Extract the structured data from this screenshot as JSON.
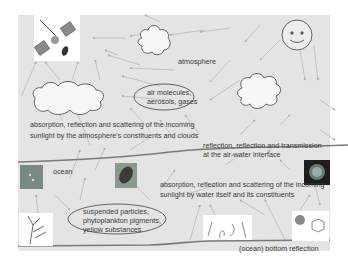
{
  "diagram": {
    "labels": {
      "atmosphere": "atmosphere",
      "ocean": "ocean",
      "air_constituents_line1": "air molecules,",
      "air_constituents_line2": "aerosols, gases",
      "atmo_process_line1": "absorption, reflection and scattering of the incoming",
      "atmo_process_line2": "sunlight by the atmosphere's constituents and clouds",
      "interface_line1": "reflection, reflection and transmission",
      "interface_line2": "at the air-water interface",
      "water_process_line1": "absorption, reflection and scattering of the incoming",
      "water_process_line2": "sunlight by water itself and its constituents",
      "water_constituents_line1": "suspended particles,",
      "water_constituents_line2": "phytoplankton pigments,",
      "water_constituents_line3": "yellow substances",
      "bottom": "(ocean) bottom reflection"
    },
    "icons": {
      "sun": "smiley-sun-icon",
      "satellite": "satellite-icon",
      "clouds": "cloud-icon"
    },
    "colors": {
      "panel": "#e4e4e4",
      "line": "#7a7a7a",
      "arrow": "#b0b0b0",
      "text": "#3a3a3a"
    }
  }
}
